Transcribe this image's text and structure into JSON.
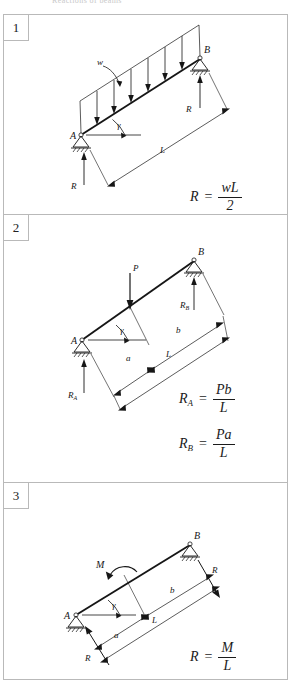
{
  "header": {
    "caption": "Reactions of beams"
  },
  "panels": [
    {
      "number": "1",
      "figure": {
        "load_label": "w",
        "support_a_label": "A",
        "support_b_label": "B",
        "angle_label": "γ",
        "span_label": "L",
        "reaction_a_label": "R",
        "reaction_b_label": "R",
        "load_type": "uniform-distributed-load",
        "arrow_count": 7
      },
      "formulas": [
        {
          "lhs": "R",
          "sub": "",
          "numerator": "wL",
          "denominator": "2"
        }
      ]
    },
    {
      "number": "2",
      "figure": {
        "load_label": "P",
        "support_a_label": "A",
        "support_b_label": "B",
        "angle_label": "γ",
        "span_label": "L",
        "dim_a_label": "a",
        "dim_b_label": "b",
        "reaction_a_label": "R",
        "reaction_a_sub": "A",
        "reaction_b_label": "R",
        "reaction_b_sub": "B",
        "load_type": "point-load"
      },
      "formulas": [
        {
          "lhs": "R",
          "sub": "A",
          "numerator": "Pb",
          "denominator": "L"
        },
        {
          "lhs": "R",
          "sub": "B",
          "numerator": "Pa",
          "denominator": "L"
        }
      ]
    },
    {
      "number": "3",
      "figure": {
        "load_label": "M",
        "support_a_label": "A",
        "support_b_label": "B",
        "angle_label": "γ",
        "span_label": "L",
        "dim_a_label": "a",
        "dim_b_label": "b",
        "reaction_a_label": "R",
        "reaction_b_label": "R",
        "load_type": "applied-moment"
      },
      "formulas": [
        {
          "lhs": "R",
          "sub": "",
          "numerator": "M",
          "denominator": "L"
        }
      ]
    }
  ],
  "colors": {
    "border": "#b9b9b9",
    "ink": "#161616",
    "background": "#ffffff"
  }
}
